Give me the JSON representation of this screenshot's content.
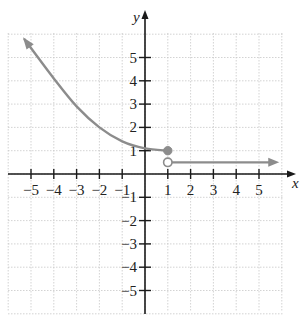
{
  "chart_data": {
    "type": "line",
    "title": "",
    "xlabel": "x",
    "ylabel": "y",
    "xlim": [
      -6,
      6
    ],
    "ylim": [
      -6,
      6
    ],
    "grid": true,
    "x_ticks": [
      -5,
      -4,
      -3,
      -2,
      -1,
      1,
      2,
      3,
      4,
      5
    ],
    "y_ticks": [
      -5,
      -4,
      -3,
      -2,
      -1,
      1,
      2,
      3,
      4,
      5
    ],
    "x_tick_labels": [
      "−5",
      "−4",
      "−3",
      "−2",
      "−1",
      "1",
      "2",
      "3",
      "4",
      "5"
    ],
    "y_tick_labels": [
      "−5",
      "−4",
      "−3",
      "−2",
      "−1",
      "1",
      "2",
      "3",
      "4",
      "5"
    ],
    "series": [
      {
        "name": "piece-1 (x ≤ 1)",
        "points": [
          [
            -5.3,
            5.8
          ],
          [
            -4,
            4.1
          ],
          [
            -3,
            2.9
          ],
          [
            -2,
            2.0
          ],
          [
            -1,
            1.4
          ],
          [
            0,
            1.1
          ],
          [
            1,
            1
          ]
        ],
        "left_arrow": true,
        "end_marker": {
          "x": 1,
          "y": 1,
          "type": "closed"
        }
      },
      {
        "name": "piece-2 (x > 1)",
        "points": [
          [
            1,
            0.5
          ],
          [
            5.8,
            0.5
          ]
        ],
        "right_arrow": true,
        "start_marker": {
          "x": 1,
          "y": 0.5,
          "type": "open"
        }
      }
    ]
  },
  "colors": {
    "axis": "#1a1a1a",
    "grid": "#c8c8c8",
    "curve": "#8c8c8c",
    "background": "#ffffff"
  }
}
